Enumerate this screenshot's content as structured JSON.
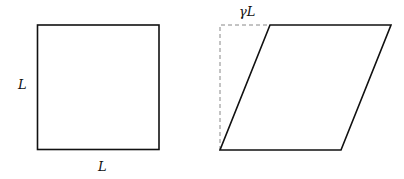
{
  "figure": {
    "left_panel": {
      "shape": "square",
      "side_label": "L",
      "bottom_label": "L"
    },
    "right_panel": {
      "shape": "sheared-parallelogram",
      "shear_label": "γL",
      "reference_outline": "dashed"
    },
    "colors": {
      "stroke": "#111111",
      "dashed": "#888888",
      "background": "#ffffff"
    }
  }
}
